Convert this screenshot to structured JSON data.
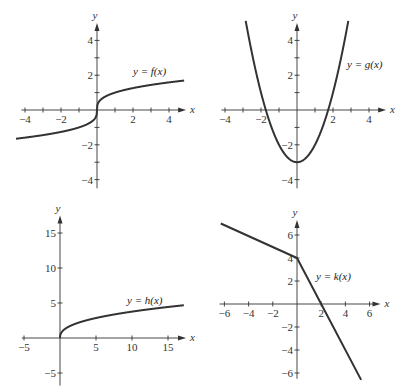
{
  "chart_data": [
    {
      "type": "line",
      "title": "",
      "label": "y = f(x)",
      "xlabel": "x",
      "ylabel": "y",
      "xlim": [
        -4.2,
        5
      ],
      "ylim": [
        -4.5,
        5
      ],
      "xticks": [
        -4,
        -2,
        2,
        4
      ],
      "yticks": [
        4,
        2,
        -2,
        -4
      ],
      "x": [
        -4.5,
        -4,
        -3,
        -2,
        -1,
        -0.5,
        -0.1,
        0,
        0.1,
        0.5,
        1,
        2,
        3,
        4,
        4.8
      ],
      "y": [
        -1.65,
        -1.59,
        -1.44,
        -1.26,
        -1.0,
        -0.79,
        -0.46,
        0,
        0.46,
        0.79,
        1.0,
        1.26,
        1.44,
        1.59,
        1.69
      ],
      "grid": false
    },
    {
      "type": "line",
      "title": "",
      "label": "y = g(x)",
      "xlabel": "x",
      "ylabel": "y",
      "xlim": [
        -4.2,
        5
      ],
      "ylim": [
        -4.5,
        5
      ],
      "xticks": [
        -4,
        -2,
        2,
        4
      ],
      "yticks": [
        4,
        2,
        -2,
        -4
      ],
      "x": [
        -2.85,
        -2.5,
        -2,
        -1.5,
        -1,
        -0.5,
        0,
        0.5,
        1,
        1.5,
        2,
        2.5,
        2.85
      ],
      "y": [
        5.12,
        3.25,
        1,
        -0.75,
        -2,
        -2.75,
        -3,
        -2.75,
        -2,
        -0.75,
        1,
        3.25,
        5.12
      ],
      "grid": false
    },
    {
      "type": "line",
      "title": "",
      "label": "y = h(x)",
      "xlabel": "x",
      "ylabel": "y",
      "xlim": [
        -5.5,
        17.5
      ],
      "ylim": [
        -7,
        17
      ],
      "xticks": [
        -5,
        5,
        10,
        15
      ],
      "yticks": [
        15,
        10,
        5,
        -5
      ],
      "x": [
        0,
        0.05,
        0.25,
        0.5,
        1,
        2,
        3,
        5,
        7,
        10,
        13,
        15,
        17
      ],
      "y": [
        0,
        0.45,
        0.86,
        1.14,
        1.5,
        1.98,
        2.33,
        2.85,
        3.27,
        3.77,
        4.2,
        4.43,
        4.66
      ],
      "grid": false
    },
    {
      "type": "line",
      "title": "",
      "label": "y = k(x)",
      "xlabel": "x",
      "ylabel": "y",
      "xlim": [
        -6.5,
        7
      ],
      "ylim": [
        -7,
        7.5
      ],
      "xticks": [
        -6,
        -4,
        -2,
        2,
        4,
        6
      ],
      "yticks": [
        6,
        4,
        2,
        -2,
        -4,
        -6
      ],
      "x": [
        -6.3,
        0,
        2,
        5.3
      ],
      "y": [
        7.0,
        4,
        0,
        -6.6
      ],
      "grid": false
    }
  ],
  "panels": [
    {
      "name": "f",
      "label": "y = f(x)",
      "axis_x": "x",
      "axis_y": "y",
      "origin": [
        97,
        110
      ],
      "sx": 18,
      "sy": 17.4,
      "xaxis": [
        -4.2,
        4.95
      ],
      "yaxis": [
        -4.5,
        5.0
      ],
      "label_pos": [
        133,
        75
      ]
    },
    {
      "name": "g",
      "label": "y = g(x)",
      "axis_x": "x",
      "axis_y": "y",
      "origin": [
        297,
        110
      ],
      "sx": 18,
      "sy": 17.4,
      "xaxis": [
        -4.2,
        4.95
      ],
      "yaxis": [
        -4.5,
        5.0
      ],
      "label_pos": [
        347,
        68
      ]
    },
    {
      "name": "h",
      "label": "y = h(x)",
      "axis_x": "x",
      "axis_y": "y",
      "origin": [
        60,
        338
      ],
      "sx": 7.2,
      "sy": 7.0,
      "xaxis": [
        -5.3,
        17.5
      ],
      "yaxis": [
        -6.8,
        17.5
      ],
      "label_pos": [
        127,
        304
      ]
    },
    {
      "name": "k",
      "label": "y = k(x)",
      "axis_x": "x",
      "axis_y": "y",
      "origin": [
        297,
        304
      ],
      "sx": 12.1,
      "sy": 11.5,
      "xaxis": [
        -6.4,
        6.9
      ],
      "yaxis": [
        -6.5,
        7.3
      ],
      "label_pos": [
        316,
        280
      ]
    }
  ]
}
